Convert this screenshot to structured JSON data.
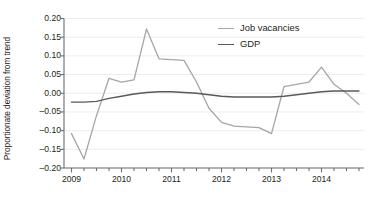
{
  "chart_data": {
    "type": "line",
    "title": "",
    "xlabel": "",
    "ylabel": "Proportionate deviation from trend",
    "ylim": [
      -0.2,
      0.2
    ],
    "ytick_labels": [
      "0.20",
      "0.15",
      "0.10",
      "0.05",
      "0.00",
      "–0.05",
      "–0.10",
      "–0.15",
      "–0.20"
    ],
    "ytick_values": [
      0.2,
      0.15,
      0.1,
      0.05,
      0.0,
      -0.05,
      -0.1,
      -0.15,
      -0.2
    ],
    "xtick_labels": [
      "2009",
      "2010",
      "2011",
      "2012",
      "2013",
      "2014"
    ],
    "xtick_values": [
      2009,
      2010,
      2011,
      2012,
      2013,
      2014
    ],
    "xlim": [
      2008.85,
      2014.85
    ],
    "minor_xticks_per_year": 4,
    "grid": "horizontal",
    "legend_position": "top-right",
    "colors": {
      "job_vacancies": "#a6a6a6",
      "gdp": "#58595b",
      "grid": "#ededed",
      "axis": "#6d6e71",
      "text": "#231f20",
      "background": "#ffffff"
    },
    "x": [
      2009.0,
      2009.25,
      2009.5,
      2009.75,
      2010.0,
      2010.25,
      2010.5,
      2010.75,
      2011.0,
      2011.25,
      2011.5,
      2011.75,
      2012.0,
      2012.25,
      2012.5,
      2012.75,
      2013.0,
      2013.25,
      2013.5,
      2013.75,
      2014.0,
      2014.25,
      2014.5,
      2014.75
    ],
    "series": [
      {
        "name": "Job vacancies",
        "color": "#a6a6a6",
        "values": [
          -0.108,
          -0.176,
          -0.06,
          0.04,
          0.03,
          0.036,
          0.172,
          0.092,
          0.09,
          0.088,
          0.03,
          -0.04,
          -0.078,
          -0.088,
          -0.09,
          -0.092,
          -0.108,
          0.018,
          0.024,
          0.03,
          0.07,
          0.024,
          0.0,
          -0.03
        ]
      },
      {
        "name": "GDP",
        "color": "#58595b",
        "values": [
          -0.024,
          -0.024,
          -0.022,
          -0.014,
          -0.008,
          -0.002,
          0.002,
          0.004,
          0.004,
          0.002,
          0.0,
          -0.004,
          -0.008,
          -0.01,
          -0.01,
          -0.01,
          -0.01,
          -0.008,
          -0.004,
          0.0,
          0.004,
          0.006,
          0.006,
          0.006
        ]
      }
    ],
    "annotations": []
  },
  "legend": {
    "items": [
      {
        "label": "Job vacancies",
        "color": "#a6a6a6"
      },
      {
        "label": "GDP",
        "color": "#58595b"
      }
    ]
  }
}
